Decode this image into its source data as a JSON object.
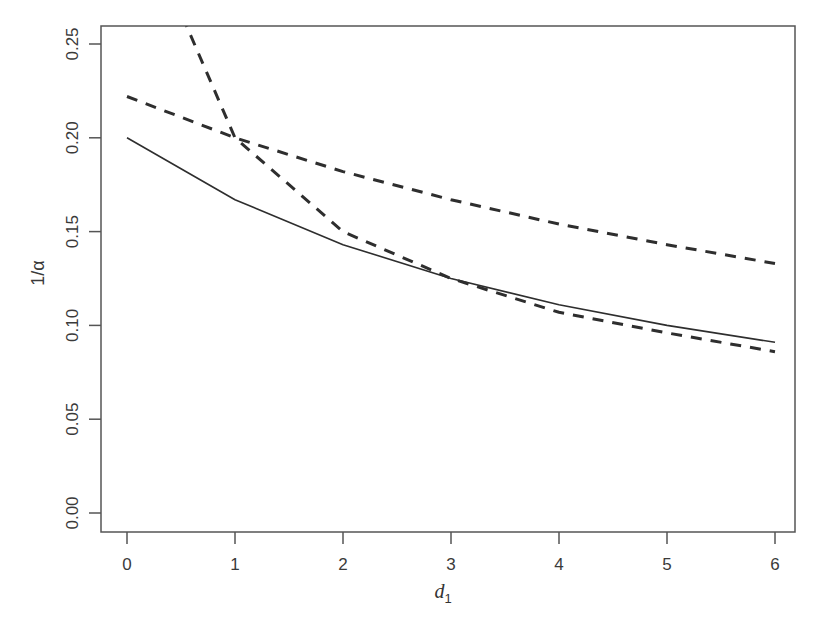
{
  "chart_data": {
    "type": "line",
    "title": "",
    "xlabel": "d",
    "xlabel_subscript": "1",
    "ylabel": "1/α",
    "xlim": [
      -0.24,
      6.2
    ],
    "ylim": [
      -0.01,
      0.26
    ],
    "grid": false,
    "legend": null,
    "x_ticks": [
      0,
      1,
      2,
      3,
      4,
      5,
      6
    ],
    "x_tick_labels": [
      "0",
      "1",
      "2",
      "3",
      "4",
      "5",
      "6"
    ],
    "y_ticks": [
      0.0,
      0.05,
      0.1,
      0.15,
      0.2,
      0.25
    ],
    "y_tick_labels": [
      "0.00",
      "0.05",
      "0.10",
      "0.15",
      "0.20",
      "0.25"
    ],
    "x": [
      0,
      1,
      2,
      3,
      4,
      5,
      6
    ],
    "series": [
      {
        "name": "solid",
        "style": "solid",
        "values": [
          0.2,
          0.167,
          0.143,
          0.125,
          0.111,
          0.1,
          0.091
        ]
      },
      {
        "name": "dashed-upper",
        "style": "dashed",
        "values": [
          0.222,
          0.2,
          0.182,
          0.167,
          0.154,
          0.143,
          0.133
        ]
      },
      {
        "name": "dashed-steep",
        "style": "dashed",
        "values": [
          0.333,
          0.2,
          0.15,
          0.125,
          0.107,
          0.096,
          0.086
        ]
      }
    ]
  },
  "colors": {
    "line": "#2e2e2e",
    "axis": "#555555",
    "background": "#ffffff"
  }
}
